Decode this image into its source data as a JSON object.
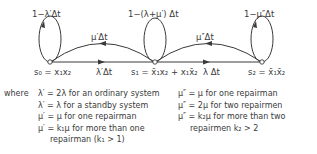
{
  "diagram": {
    "type": "markov_state_transition",
    "states": [
      {
        "id": "s0",
        "label": "s₀ = x₁x₂",
        "self_loop": "1−λ′Δt"
      },
      {
        "id": "s1",
        "label": "s₁ = x̄₁x₂ + x₁x̄₂",
        "self_loop": "1−(λ+μ′) Δt"
      },
      {
        "id": "s2",
        "label": "s₂ = x̄₁x̄₂",
        "self_loop": "1−μ″Δt"
      }
    ],
    "transitions": [
      {
        "from": "s0",
        "to": "s1",
        "label": "λ′Δt"
      },
      {
        "from": "s1",
        "to": "s0",
        "label": "μ′Δt"
      },
      {
        "from": "s1",
        "to": "s2",
        "label": "λ Δt"
      },
      {
        "from": "s2",
        "to": "s1",
        "label": "μ″Δt"
      }
    ]
  },
  "legend": {
    "where": "where",
    "left": [
      "λ′ = 2λ  for an ordinary system",
      "λ′ = λ  for a standby system",
      "μ′ = μ  for one repairman",
      "μ′ = k₁μ  for more than one",
      "repairman  (k₁ > 1)"
    ],
    "right": [
      "μ″ = μ  for one repairman",
      "μ″ = 2μ  for two repairmen",
      "μ″ = k₂μ  for more than two",
      "repairmen  k₂ > 2"
    ]
  },
  "colors": {
    "line": "#3a3a3a",
    "text": "#3a3a3a",
    "background": "#ffffff"
  }
}
